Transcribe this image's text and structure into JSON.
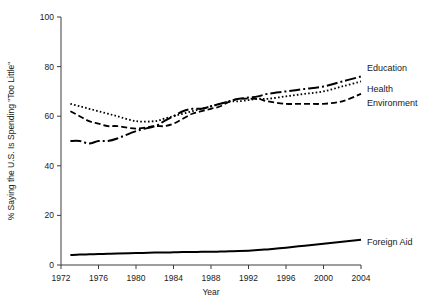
{
  "chart_data": {
    "type": "line",
    "title": "",
    "xlabel": "Year",
    "ylabel": "% Saying the U.S. Is Spending \"Too Little\"",
    "xlim": [
      1972,
      2004
    ],
    "ylim": [
      0,
      100
    ],
    "grid": false,
    "legend_position": "right-inline-labels",
    "xticks": [
      "1972",
      "1976",
      "1980",
      "1984",
      "1988",
      "1992",
      "1996",
      "2000",
      "2004"
    ],
    "xtick_values": [
      1972,
      1976,
      1980,
      1984,
      1988,
      1992,
      1996,
      2000,
      2004
    ],
    "yticks": [
      "0",
      "20",
      "40",
      "60",
      "80",
      "100"
    ],
    "ytick_values": [
      0,
      20,
      40,
      60,
      80,
      100
    ],
    "x": [
      1973,
      1974,
      1975,
      1976,
      1977,
      1978,
      1980,
      1982,
      1983,
      1984,
      1985,
      1986,
      1987,
      1988,
      1989,
      1990,
      1991,
      1993,
      1994,
      1996,
      1998,
      2000,
      2002,
      2004
    ],
    "series": [
      {
        "name": "Education",
        "label": "Education",
        "style": "dash-dot",
        "dasharray": "11,3,2,3",
        "width": 2.0,
        "values": [
          50,
          50,
          49,
          50,
          50,
          51,
          54,
          56,
          58,
          60,
          62,
          63,
          63,
          64,
          65,
          66,
          67,
          68,
          69,
          70,
          71,
          72,
          74,
          76
        ]
      },
      {
        "name": "Health",
        "label": "Health",
        "style": "dotted",
        "dasharray": "1.6,2.2",
        "width": 1.8,
        "values": [
          65,
          64,
          63,
          62,
          61,
          60,
          58,
          58,
          59,
          60,
          61,
          62,
          63,
          64,
          65,
          66,
          66,
          67,
          67,
          68,
          69,
          70,
          72,
          74
        ]
      },
      {
        "name": "Environment",
        "label": "Environment",
        "style": "dashed",
        "dasharray": "6,3",
        "width": 1.8,
        "values": [
          62,
          60,
          58,
          57,
          56,
          56,
          55,
          56,
          56,
          57,
          59,
          61,
          62,
          63,
          64,
          66,
          67,
          67,
          66,
          65,
          65,
          65,
          66,
          69
        ]
      },
      {
        "name": "Foreign Aid",
        "label": "Foreign Aid",
        "style": "solid",
        "dasharray": "",
        "width": 2.0,
        "values": [
          4.0,
          4.2,
          4.3,
          4.4,
          4.5,
          4.6,
          4.8,
          5.0,
          5.0,
          5.1,
          5.2,
          5.2,
          5.3,
          5.3,
          5.4,
          5.5,
          5.6,
          6.0,
          6.3,
          7.0,
          7.8,
          8.6,
          9.4,
          10.2
        ]
      }
    ]
  },
  "labels": {
    "education": "Education",
    "health": "Health",
    "environment": "Environment",
    "foreign_aid": "Foreign Aid"
  },
  "axes": {
    "x_title": "Year",
    "y_title": "% Saying the U.S. Is Spending \"Too Little\""
  },
  "colors": {
    "line": "#000000",
    "axis": "#3d3d3d",
    "text": "#1a1a1a",
    "background": "#ffffff"
  }
}
